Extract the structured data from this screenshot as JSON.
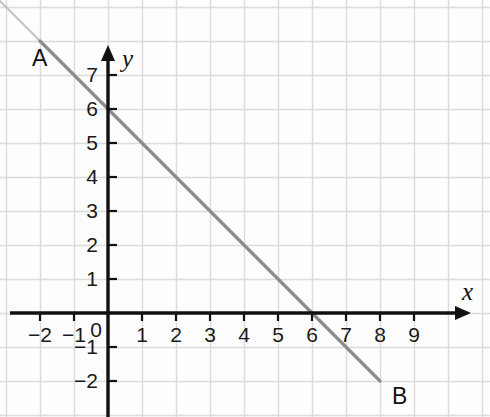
{
  "chart_data": {
    "type": "line",
    "title": "",
    "xlabel": "x",
    "ylabel": "y",
    "grid": true,
    "legend_position": "none",
    "xlim": [
      -3,
      10.6
    ],
    "ylim": [
      -3,
      8.2
    ],
    "x_ticks": [
      "−2",
      "−1",
      "0",
      "1",
      "2",
      "3",
      "4",
      "5",
      "6",
      "7",
      "8",
      "9"
    ],
    "x_tick_values": [
      -2,
      -1,
      0,
      1,
      2,
      3,
      4,
      5,
      6,
      7,
      8,
      9
    ],
    "y_ticks": [
      "7",
      "6",
      "5",
      "4",
      "3",
      "2",
      "1",
      "−1",
      "−2"
    ],
    "y_tick_values": [
      7,
      6,
      5,
      4,
      3,
      2,
      1,
      -1,
      -2
    ],
    "series": [
      {
        "name": "AB",
        "equation": "y = -x + 6",
        "slope": -1,
        "intercept": 6,
        "x": [
          -2,
          8
        ],
        "values": [
          8,
          -2
        ],
        "color": "#8c8c8c"
      }
    ],
    "annotations": [
      {
        "label": "A",
        "x": -2,
        "y": 8
      },
      {
        "label": "B",
        "x": 8,
        "y": -2
      }
    ],
    "x_intercept": 6,
    "y_intercept": 6
  },
  "axes": {
    "x_label": "x",
    "y_label": "y"
  },
  "points": {
    "a_label": "A",
    "b_label": "B"
  },
  "ticks": {
    "x": [
      "−2",
      "−1",
      "0",
      "1",
      "2",
      "3",
      "4",
      "5",
      "6",
      "7",
      "8",
      "9"
    ],
    "y": [
      "7",
      "6",
      "5",
      "4",
      "3",
      "2",
      "1",
      "−1",
      "−2"
    ]
  },
  "colors": {
    "line": "#8c8c8c",
    "axis": "#111111",
    "grid": "#dcdcdc",
    "background": "#fdfdfd",
    "text": "#111111"
  }
}
